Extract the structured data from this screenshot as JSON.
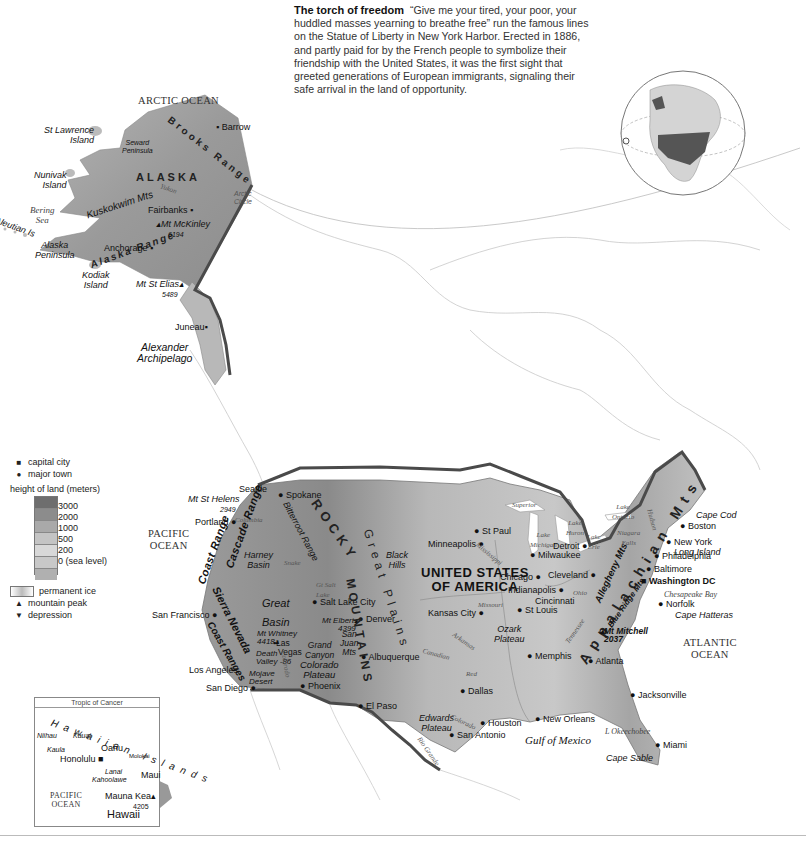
{
  "caption": {
    "title": "The torch of freedom",
    "text": "“Give me your tired, your poor, your huddled masses yearning to breathe free” run the famous lines on the Statue of Liberty in New York Harbor. Erected in 1886, and partly paid for by the French people to symbolize their friendship with the United States, it was the first sight that greeted generations of European immigrants, signaling their safe arrival in the land of opportunity."
  },
  "country": {
    "name_line1": "UNITED STATES",
    "name_line2": "OF AMERICA"
  },
  "oceans": {
    "arctic": "ARCTIC OCEAN",
    "pacific_line1": "PACIFIC",
    "pacific_line2": "OCEAN",
    "atlantic_line1": "ATLANTIC",
    "atlantic_line2": "OCEAN",
    "gulf": "Gulf of Mexico",
    "bering_line1": "Bering",
    "bering_line2": "Sea"
  },
  "alaska": {
    "name": "ALASKA",
    "brooks": "Brooks Range",
    "kuskokwim": "Kuskokwim Mts",
    "alaska_range": "Alaska Range",
    "yukon": "Yukon",
    "seward_line1": "Seward",
    "seward_line2": "Peninsula",
    "st_lawrence_line1": "St Lawrence",
    "st_lawrence_line2": "Island",
    "nunivak_line1": "Nunivak",
    "nunivak_line2": "Island",
    "aleutian": "Aleutian Is",
    "alaska_pen_line1": "Alaska",
    "alaska_pen_line2": "Peninsula",
    "kodiak_line1": "Kodiak",
    "kodiak_line2": "Island",
    "barrow": "Barrow",
    "fairbanks": "Fairbanks",
    "mckinley": "Mt McKinley",
    "mckinley_height": "6194",
    "anchorage": "Anchorage",
    "st_elias": "Mt St Elias",
    "st_elias_height": "5489",
    "juneau": "Juneau",
    "arctic_circle_line1": "Arctic",
    "arctic_circle_line2": "Circle",
    "alexander_line1": "Alexander",
    "alexander_line2": "Archipelago"
  },
  "west": {
    "seattle": "Seattle",
    "st_helens": "Mt St Helens",
    "st_helens_height": "2949",
    "portland": "Portland",
    "columbia": "Columbia",
    "spokane": "Spokane",
    "coast_range": "Coast Range",
    "cascade_range": "Cascade Range",
    "bitterroot": "Bitterroot Range",
    "harney_line1": "Harney",
    "harney_line2": "Basin",
    "snake": "Snake",
    "great_salt_line1": "Gt Salt",
    "great_salt_line2": "Lake",
    "salt_lake_city": "Salt Lake City",
    "great_basin_line1": "Great",
    "great_basin_line2": "Basin",
    "sierra_nevada": "Sierra Nevada",
    "san_francisco": "San Francisco",
    "coast_ranges": "Coast Ranges",
    "whitney": "Mt Whitney",
    "whitney_height": "4418",
    "las_vegas_line1": "Las",
    "las_vegas_line2": "Vegas",
    "death_valley_line1": "Death",
    "death_valley_line2": "Valley",
    "death_valley_depth": "-86",
    "mojave_line1": "Mojave",
    "mojave_line2": "Desert",
    "colorado_river": "Colorado",
    "grand_canyon_line1": "Grand",
    "grand_canyon_line2": "Canyon",
    "colorado_plateau_line1": "Colorado",
    "colorado_plateau_line2": "Plateau",
    "los_angeles": "Los Angeles",
    "san_diego": "San Diego",
    "phoenix": "Phoenix",
    "elbert": "Mt Elbert",
    "elbert_height": "4399",
    "san_juan_line1": "San",
    "san_juan_line2": "Juan",
    "san_juan_line3": "Mts",
    "denver": "Denver",
    "albuquerque": "Albuquerque",
    "el_paso": "El Paso",
    "rocky_line1": "ROCKY",
    "rocky_line2": "MOUNTAINS"
  },
  "central": {
    "great_plains": "Great Plains",
    "black_hills_line1": "Black",
    "black_hills_line2": "Hills",
    "minneapolis": "Minneapolis",
    "st_paul": "St Paul",
    "mississippi": "Mississippi",
    "superior": "Superior",
    "lake_michigan_line1": "Lake",
    "lake_michigan_line2": "Michigan",
    "lake_huron_line1": "Lake",
    "lake_huron_line2": "Huron",
    "lake_erie_line1": "Lake",
    "lake_erie_line2": "Erie",
    "lake_ontario_line1": "Lake",
    "lake_ontario_line2": "Ontario",
    "chicago": "Chicago",
    "milwaukee": "Milwaukee",
    "detroit": "Detroit",
    "cleveland": "Cleveland",
    "indianapolis": "Indianapolis",
    "cincinnati": "Cincinnati",
    "ohio": "Ohio",
    "kansas_city": "Kansas City",
    "missouri": "Missouri",
    "st_louis": "St Louis",
    "ozark_line1": "Ozark",
    "ozark_line2": "Plateau",
    "arkansas": "Arkansas",
    "canadian": "Canadian",
    "red": "Red",
    "memphis": "Memphis",
    "tennessee": "Tennessee",
    "dallas": "Dallas",
    "edwards_line1": "Edwards",
    "edwards_line2": "Plateau",
    "colorado_tx": "Colorado",
    "rio_grande": "Rio Grande",
    "houston": "Houston",
    "san_antonio": "San Antonio",
    "new_orleans": "New Orleans"
  },
  "east": {
    "appalachian": "Appalachian Mts",
    "allegheny": "Allegheny Mts",
    "blue_ridge": "Blue Ridge Mts",
    "niagara_line1": "Niagara",
    "niagara_line2": "Falls",
    "hudson": "Hudson",
    "boston": "Boston",
    "cape_cod": "Cape Cod",
    "new_york": "New York",
    "long_island": "Long Island",
    "philadelphia": "Philadelphia",
    "baltimore": "Baltimore",
    "washington": "Washington DC",
    "chesapeake": "Chesapeake Bay",
    "norfolk": "Norfolk",
    "cape_hatteras": "Cape Hatteras",
    "mitchell": "Mt Mitchell",
    "mitchell_height": "2037",
    "atlanta": "Atlanta",
    "jacksonville": "Jacksonville",
    "okeechobee": "L Okeechobee",
    "miami": "Miami",
    "cape_sable": "Cape Sable"
  },
  "hawaii_inset": {
    "tropic": "Tropic of Cancer",
    "islands_title": "Hawaiian Islands",
    "niihau": "Niihau",
    "kauai": "Kauai",
    "kaula": "Kaula",
    "oahu": "Oahu",
    "honolulu": "Honolulu",
    "molokai": "Molokai",
    "lanai": "Lanai",
    "kahoolawe": "Kahoolawe",
    "maui": "Maui",
    "pacific_line1": "PACIFIC",
    "pacific_line2": "OCEAN",
    "mauna_kea": "Mauna Kea",
    "mauna_kea_height": "4205",
    "hawaii": "Hawaii"
  },
  "legend": {
    "capital_city": "capital city",
    "major_town": "major town",
    "height_title": "height of land (meters)",
    "heights": [
      "3000",
      "2000",
      "1000",
      "500",
      "200",
      "0 (sea level)"
    ],
    "permanent_ice": "permanent ice",
    "mountain_peak": "mountain peak",
    "depression": "depression",
    "ramp_colors": [
      "#6e6e6e",
      "#8c8c8c",
      "#a9a9a9",
      "#c4c4c4",
      "#d6d6d6",
      "#c8c8c8",
      "#b0b0b0"
    ]
  },
  "colors": {
    "border": "#4a4a4a",
    "land_us": "#c9c9c9",
    "land_high": "#8a8a8a",
    "outline": "#b5b5b5",
    "globe_us": "#555555",
    "globe_land": "#d4d4d4"
  }
}
